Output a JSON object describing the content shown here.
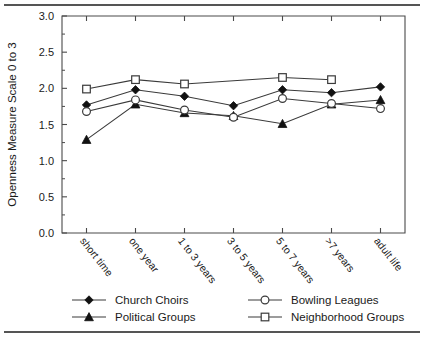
{
  "figure": {
    "background_color": "#ffffff",
    "rule_color": "#555555",
    "axis_color": "#4a4a4a",
    "series_line_color": "#3a3a3a",
    "marker_fill_dark": "#111111",
    "marker_fill_open": "#ffffff"
  },
  "chart_data": {
    "type": "line",
    "title": "",
    "xlabel": "",
    "ylabel": "Openness Measure Scale 0 to 3",
    "ylim": [
      0.0,
      3.0
    ],
    "ytick_labels": [
      "0.0",
      "0.5",
      "1.0",
      "1.5",
      "2.0",
      "2.5",
      "3.0"
    ],
    "ytick_values": [
      0.0,
      0.5,
      1.0,
      1.5,
      2.0,
      2.5,
      3.0
    ],
    "grid": false,
    "legend_position": "below-axes",
    "categories": [
      "short time",
      "one year",
      "1 to 3 years",
      "3 to 5 years",
      "5 to 7 years",
      ">7 years",
      "adult life"
    ],
    "series": [
      {
        "name": "Church Choirs",
        "marker": "filled-diamond",
        "values": [
          1.77,
          1.98,
          1.89,
          1.76,
          1.98,
          1.94,
          2.02
        ]
      },
      {
        "name": "Political Groups",
        "marker": "filled-triangle",
        "values": [
          1.29,
          1.78,
          1.66,
          1.62,
          1.51,
          1.78,
          1.84
        ]
      },
      {
        "name": "Bowling Leagues",
        "marker": "open-circle",
        "values": [
          1.68,
          1.84,
          1.7,
          1.6,
          1.86,
          1.79,
          1.72
        ]
      },
      {
        "name": "Neighborhood Groups",
        "marker": "open-square",
        "values": [
          1.99,
          2.12,
          2.06,
          null,
          2.15,
          2.12,
          null
        ]
      }
    ]
  },
  "legend": {
    "entries": [
      {
        "label": "Church Choirs",
        "marker": "filled-diamond"
      },
      {
        "label": "Political Groups",
        "marker": "filled-triangle"
      },
      {
        "label": "Bowling Leagues",
        "marker": "open-circle"
      },
      {
        "label": "Neighborhood Groups",
        "marker": "open-square"
      }
    ]
  }
}
